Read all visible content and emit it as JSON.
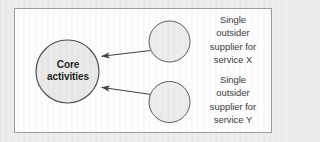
{
  "figure": {
    "type": "diagram",
    "panel": {
      "background_color": "#fdfdfd",
      "border_color": "#9a9c9e",
      "page_background_color": "#eceded"
    },
    "nodes": [
      {
        "id": "core-activities",
        "shape": "circle",
        "label_lines": [
          "Core",
          "activities"
        ],
        "fill_color": "#e9e9e9",
        "stroke_color": "#4d4d4f",
        "text_color": "#231f20",
        "bold": true,
        "cx": 67.5,
        "cy": 71.5,
        "r": 31.5
      },
      {
        "id": "supplier-x",
        "shape": "circle",
        "label_lines": [],
        "fill_color": "#ededed",
        "stroke_color": "#58595b",
        "cx": 169.5,
        "cy": 41.5,
        "r": 20.5
      },
      {
        "id": "supplier-y",
        "shape": "circle",
        "label_lines": [],
        "fill_color": "#ededed",
        "stroke_color": "#58595b",
        "cx": 169.5,
        "cy": 102.0,
        "r": 20.5
      }
    ],
    "arrows": [
      {
        "id": "arrow-supplier-x-to-core",
        "from": "supplier-x",
        "to": "core-activities",
        "direction": "left-down",
        "stroke_color": "#3f3f41"
      },
      {
        "id": "arrow-supplier-y-to-core",
        "from": "supplier-y",
        "to": "core-activities",
        "direction": "left-up",
        "stroke_color": "#3f3f41"
      }
    ],
    "captions": {
      "supplier_x": {
        "lines": [
          "Single",
          "outsider",
          "supplier for",
          "service X"
        ],
        "text_color": "#3a3a3c"
      },
      "supplier_y": {
        "lines": [
          "Single",
          "outsider",
          "supplier for",
          "service Y"
        ],
        "text_color": "#3a3a3c"
      }
    }
  }
}
